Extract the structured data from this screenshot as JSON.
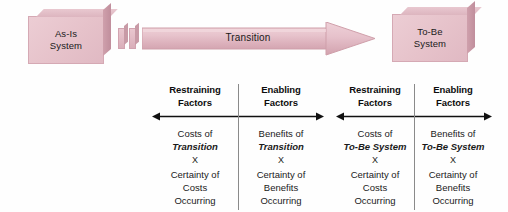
{
  "diagram": {
    "title_hidden": "",
    "colors": {
      "box_fill": "#e6c2ca",
      "box_shade": "#c08e9c",
      "arrow_fill": "#e3bcc6",
      "text": "#1a1a1a",
      "rule": "#8a8a8a"
    }
  },
  "flow": {
    "as_is_box": {
      "line1": "As-Is",
      "line2": "System"
    },
    "to_be_box": {
      "line1": "To-Be",
      "line2": "System"
    },
    "arrow_label": "Transition"
  },
  "tables": [
    {
      "id": "transition",
      "columns": [
        {
          "header_line1": "Restraining",
          "header_line2": "Factors",
          "body": [
            {
              "text": "Costs of",
              "style": "normal"
            },
            {
              "text": "Transition",
              "style": "bold-italic"
            },
            {
              "text": "X",
              "style": "multiply"
            },
            {
              "text": "Certainty of",
              "style": "normal"
            },
            {
              "text": "Costs",
              "style": "normal"
            },
            {
              "text": "Occurring",
              "style": "normal"
            }
          ]
        },
        {
          "header_line1": "Enabling",
          "header_line2": "Factors",
          "body": [
            {
              "text": "Benefits of",
              "style": "normal"
            },
            {
              "text": "Transition",
              "style": "bold-italic"
            },
            {
              "text": "X",
              "style": "multiply"
            },
            {
              "text": "Certainty of",
              "style": "normal"
            },
            {
              "text": "Benefits",
              "style": "normal"
            },
            {
              "text": "Occurring",
              "style": "normal"
            }
          ]
        }
      ]
    },
    {
      "id": "to-be-system",
      "columns": [
        {
          "header_line1": "Restraining",
          "header_line2": "Factors",
          "body": [
            {
              "text": "Costs of",
              "style": "normal"
            },
            {
              "text": "To-Be System",
              "style": "bold-italic"
            },
            {
              "text": "X",
              "style": "multiply"
            },
            {
              "text": "Certainty of",
              "style": "normal"
            },
            {
              "text": "Costs",
              "style": "normal"
            },
            {
              "text": "Occurring",
              "style": "normal"
            }
          ]
        },
        {
          "header_line1": "Enabling",
          "header_line2": "Factors",
          "body": [
            {
              "text": "Benefits of",
              "style": "normal"
            },
            {
              "text": "To-Be System",
              "style": "bold-italic"
            },
            {
              "text": "X",
              "style": "multiply"
            },
            {
              "text": "Certainty of",
              "style": "normal"
            },
            {
              "text": "Benefits",
              "style": "normal"
            },
            {
              "text": "Occurring",
              "style": "normal"
            }
          ]
        }
      ]
    }
  ]
}
